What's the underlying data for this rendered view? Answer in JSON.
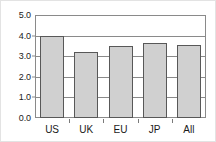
{
  "chart_data": {
    "type": "bar",
    "title": "",
    "subtitle": "",
    "xlabel": "",
    "ylabel": "",
    "categories": [
      "US",
      "UK",
      "EU",
      "JP",
      "All"
    ],
    "values": [
      4.0,
      3.2,
      3.5,
      3.65,
      3.55
    ],
    "series": [
      {
        "name": "",
        "values": [
          4.0,
          3.2,
          3.5,
          3.65,
          3.55
        ]
      }
    ],
    "ylim": [
      0.0,
      5.0
    ],
    "ytick_labels": [
      "0.0",
      "1.0",
      "2.0",
      "3.0",
      "4.0",
      "5.0"
    ],
    "ytick_values": [
      0.0,
      1.0,
      2.0,
      3.0,
      4.0,
      5.0
    ],
    "grid": true,
    "grid_axis": "y",
    "legend": false,
    "legend_position": "none",
    "annotations": [],
    "colors": {
      "bar_fill": "#d0d0d0",
      "bar_border": "#585858",
      "axis": "#8a8a8a",
      "grid": "#8a8a8a",
      "text": "#1a1a1a",
      "background": "#ffffff",
      "outer_border": "#e3e3e3"
    }
  }
}
